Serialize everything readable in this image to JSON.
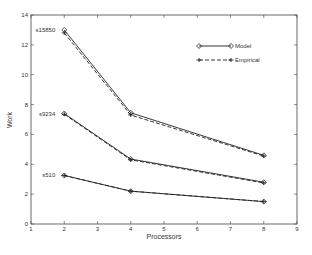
{
  "chart_data": {
    "type": "line",
    "title": "",
    "xlabel": "Processors",
    "ylabel": "Work",
    "xlim": [
      1,
      9
    ],
    "ylim": [
      0,
      14
    ],
    "x_ticks": [
      1,
      2,
      3,
      4,
      5,
      6,
      7,
      8,
      9
    ],
    "y_ticks": [
      0,
      2,
      4,
      6,
      8,
      10,
      12,
      14
    ],
    "grid": false,
    "legend": {
      "position": "upper right",
      "entries": [
        "Model",
        "Empirical"
      ]
    },
    "x": [
      2,
      4,
      8
    ],
    "series": [
      {
        "name": "s15850 Model",
        "group": "s15850",
        "kind": "Model",
        "values": [
          13.0,
          7.45,
          4.6
        ]
      },
      {
        "name": "s15850 Empirical",
        "group": "s15850",
        "kind": "Empirical",
        "values": [
          12.8,
          7.3,
          4.55
        ]
      },
      {
        "name": "s9234 Model",
        "group": "s9234",
        "kind": "Model",
        "values": [
          7.4,
          4.35,
          2.8
        ]
      },
      {
        "name": "s9234 Empirical",
        "group": "s9234",
        "kind": "Empirical",
        "values": [
          7.35,
          4.3,
          2.75
        ]
      },
      {
        "name": "s510 Model",
        "group": "s510",
        "kind": "Model",
        "values": [
          3.25,
          2.2,
          1.5
        ]
      },
      {
        "name": "s510 Empirical",
        "group": "s510",
        "kind": "Empirical",
        "values": [
          3.25,
          2.2,
          1.5
        ]
      }
    ],
    "annotations": [
      {
        "text": "s15850",
        "x": 2,
        "y": 13.0
      },
      {
        "text": "s9234",
        "x": 2,
        "y": 7.4
      },
      {
        "text": "s510",
        "x": 2,
        "y": 3.25
      }
    ]
  },
  "colors": {
    "line": "#222222",
    "axis": "#444444",
    "text": "#333333"
  }
}
